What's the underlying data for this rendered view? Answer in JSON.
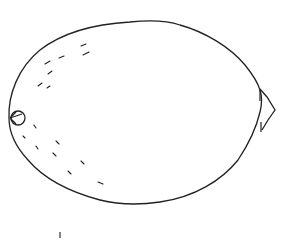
{
  "image": {
    "subject": "lemon line drawing",
    "background": "#ffffff",
    "stroke": "#222222",
    "caption": ""
  }
}
